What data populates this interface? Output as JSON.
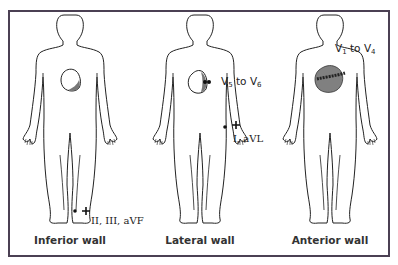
{
  "colors": {
    "frame": "#4b4053",
    "outline": "#222222",
    "heart_fill": "#888888",
    "heart_shade": "#666666"
  },
  "figures": [
    {
      "caption": "Inferior wall",
      "lead_label": "II, III, aVF",
      "electrode_location": "left leg",
      "polarity": "+"
    },
    {
      "caption": "Lateral wall",
      "chest_leads": {
        "prefix": "V",
        "from": "5",
        "joiner": " to ",
        "to": "6"
      },
      "lead_label": "I, aVL",
      "electrode_location": "left wrist",
      "polarity": "+"
    },
    {
      "caption": "Anterior wall",
      "chest_leads": {
        "prefix": "V",
        "from": "1",
        "joiner": " to ",
        "to": "4"
      }
    }
  ]
}
